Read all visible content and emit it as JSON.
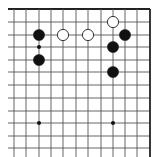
{
  "diagram": {
    "type": "go-board-fragment",
    "grid": {
      "columns_x": [
        14,
        26,
        39,
        51,
        63,
        76,
        88,
        101,
        113,
        125,
        137,
        150
      ],
      "rows_y": [
        9,
        22,
        35,
        47,
        60,
        72,
        85,
        98,
        111,
        123,
        136,
        148
      ],
      "left_extent_x": 8,
      "bottom_extent_y": 157,
      "top_edge_thick": true,
      "right_edge_thick": true,
      "line_color": "#555555",
      "edge_color": "#222222"
    },
    "stones": [
      {
        "color": "black",
        "col": 2,
        "row": 2
      },
      {
        "color": "black",
        "col": 2,
        "row": 4
      },
      {
        "color": "white",
        "col": 4,
        "row": 2
      },
      {
        "color": "white",
        "col": 6,
        "row": 2
      },
      {
        "color": "white",
        "col": 8,
        "row": 1
      },
      {
        "color": "black",
        "col": 9,
        "row": 2
      },
      {
        "color": "black",
        "col": 8,
        "row": 3
      },
      {
        "color": "black",
        "col": 8,
        "row": 5
      }
    ],
    "marks": [
      {
        "type": "small-dot",
        "col": 2,
        "row": 3
      }
    ],
    "star_points": [
      {
        "col": 2,
        "row": 9
      },
      {
        "col": 8,
        "row": 9
      }
    ],
    "colors": {
      "black_stone": "#111111",
      "white_stone_fill": "#ffffff",
      "white_stone_stroke": "#222222",
      "background": "#ffffff"
    }
  }
}
